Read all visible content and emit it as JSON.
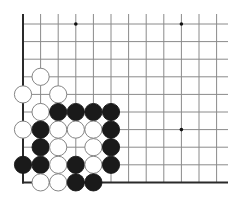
{
  "diagram": {
    "type": "go-board-fragment",
    "background": "#ffffff",
    "line_color": "#8a8a8a",
    "edge_color": "#2a2a2a",
    "black_stone_color": "#1a1a1a",
    "white_stone_color": "#ffffff",
    "stone_outline_color": "#777777",
    "columns": 12,
    "rows": 10,
    "left_edge": true,
    "bottom_edge": true,
    "star_points": [
      [
        3,
        0
      ],
      [
        9,
        0
      ],
      [
        9,
        6
      ]
    ],
    "stones": [
      {
        "col": 1,
        "row": 3,
        "color": "white"
      },
      {
        "col": 0,
        "row": 4,
        "color": "white"
      },
      {
        "col": 2,
        "row": 4,
        "color": "white"
      },
      {
        "col": 1,
        "row": 5,
        "color": "white"
      },
      {
        "col": 2,
        "row": 5,
        "color": "black"
      },
      {
        "col": 3,
        "row": 5,
        "color": "black"
      },
      {
        "col": 4,
        "row": 5,
        "color": "black"
      },
      {
        "col": 5,
        "row": 5,
        "color": "black"
      },
      {
        "col": 0,
        "row": 6,
        "color": "white"
      },
      {
        "col": 1,
        "row": 6,
        "color": "black"
      },
      {
        "col": 2,
        "row": 6,
        "color": "white"
      },
      {
        "col": 3,
        "row": 6,
        "color": "white"
      },
      {
        "col": 4,
        "row": 6,
        "color": "white"
      },
      {
        "col": 5,
        "row": 6,
        "color": "black"
      },
      {
        "col": 1,
        "row": 7,
        "color": "black"
      },
      {
        "col": 2,
        "row": 7,
        "color": "white"
      },
      {
        "col": 4,
        "row": 7,
        "color": "white"
      },
      {
        "col": 5,
        "row": 7,
        "color": "black"
      },
      {
        "col": 0,
        "row": 8,
        "color": "black"
      },
      {
        "col": 1,
        "row": 8,
        "color": "black"
      },
      {
        "col": 2,
        "row": 8,
        "color": "white"
      },
      {
        "col": 3,
        "row": 8,
        "color": "black"
      },
      {
        "col": 4,
        "row": 8,
        "color": "white"
      },
      {
        "col": 5,
        "row": 8,
        "color": "black"
      },
      {
        "col": 1,
        "row": 9,
        "color": "white"
      },
      {
        "col": 2,
        "row": 9,
        "color": "white"
      },
      {
        "col": 3,
        "row": 9,
        "color": "black"
      },
      {
        "col": 4,
        "row": 9,
        "color": "black"
      }
    ]
  }
}
